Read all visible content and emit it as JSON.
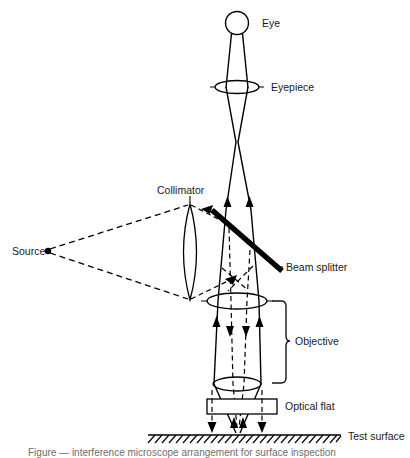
{
  "figure": {
    "background_color": "#ffffff",
    "ink_color": "#000000",
    "width": 410,
    "height": 458
  },
  "labels": {
    "eye": "Eye",
    "eyepiece": "Eyepiece",
    "collimator": "Collimator",
    "source": "Source",
    "beam_splitter": "Beam splitter",
    "objective": "Objective",
    "optical_flat": "Optical flat",
    "test_surface": "Test surface"
  },
  "caption": {
    "text": "Figure — interference microscope arrangement for surface inspection"
  },
  "components": {
    "eye": {
      "shape": "circle",
      "cx": 237,
      "cy": 23,
      "r": 11.5
    },
    "eyepiece": {
      "shape": "lens",
      "cx": 237,
      "cy": 87,
      "rx": 22,
      "ry": 6.5
    },
    "collimator": {
      "shape": "lens",
      "cx": 190,
      "cy": 252,
      "rx": 13,
      "ry": 48
    },
    "objective_upper": {
      "shape": "lens",
      "cx": 237,
      "cy": 301,
      "rx": 30,
      "ry": 8
    },
    "objective_lower": {
      "shape": "lens",
      "cx": 237,
      "cy": 384,
      "rx": 24,
      "ry": 7
    },
    "beam_splitter": {
      "shape": "bar",
      "x1": 212,
      "y1": 210,
      "x2": 282,
      "y2": 271,
      "thickness": 5.4
    },
    "optical_flat": {
      "shape": "rect",
      "x": 207,
      "y": 399,
      "width": 70,
      "height": 15
    },
    "test_surface": {
      "shape": "hatched-line",
      "x1": 148,
      "x2": 341,
      "y": 435
    },
    "source": {
      "shape": "dot",
      "cx": 48,
      "cy": 251,
      "r": 3
    }
  },
  "ray_paths": {
    "illumination_style": "dashed",
    "imaging_style": "solid",
    "arrow_directions": [
      "up",
      "down"
    ]
  }
}
